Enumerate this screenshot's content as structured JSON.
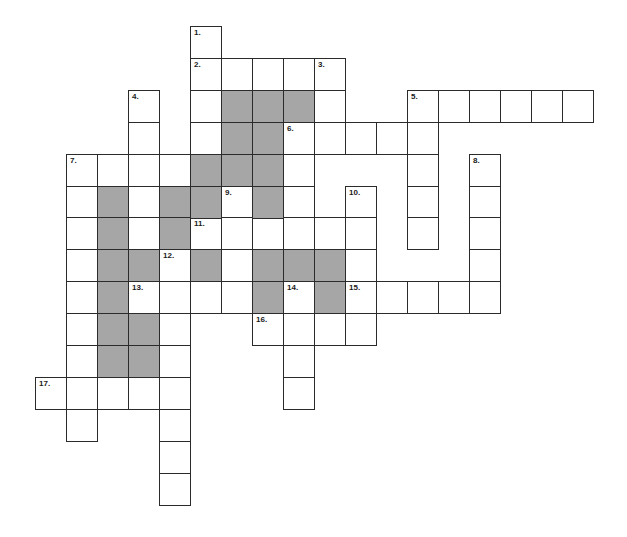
{
  "puzzle": {
    "type": "crossword",
    "grid": {
      "origin_x": 35,
      "origin_y": 26,
      "cell_w": 31,
      "cell_h": 31.9,
      "colors": {
        "border": "#2b2b2b",
        "white": "#ffffff",
        "shaded": "#a6a6a6"
      }
    },
    "entries": [
      {
        "number": "1.",
        "direction": "down",
        "col": 5,
        "row": 0,
        "length": 4
      },
      {
        "number": "2.",
        "direction": "across",
        "col": 5,
        "row": 1,
        "length": 5
      },
      {
        "number": "3.",
        "direction": "down",
        "col": 9,
        "row": 1,
        "length": 3
      },
      {
        "number": "4.",
        "direction": "down",
        "col": 3,
        "row": 2,
        "length": 5
      },
      {
        "number": "5.",
        "direction": "across",
        "col": 12,
        "row": 2,
        "length": 6
      },
      {
        "number": "5.",
        "direction": "down",
        "col": 12,
        "row": 2,
        "length": 5
      },
      {
        "number": "6.",
        "direction": "across",
        "col": 8,
        "row": 3,
        "length": 5
      },
      {
        "number": "6.",
        "direction": "down",
        "col": 8,
        "row": 3,
        "length": 4
      },
      {
        "number": "7.",
        "direction": "across",
        "col": 1,
        "row": 4,
        "length": 4
      },
      {
        "number": "7.",
        "direction": "down",
        "col": 1,
        "row": 4,
        "length": 9
      },
      {
        "number": "8.",
        "direction": "down",
        "col": 14,
        "row": 4,
        "length": 5
      },
      {
        "number": "9.",
        "direction": "down",
        "col": 6,
        "row": 5,
        "length": 4
      },
      {
        "number": "10.",
        "direction": "down",
        "col": 10,
        "row": 5,
        "length": 5
      },
      {
        "number": "11.",
        "direction": "across",
        "col": 5,
        "row": 6,
        "length": 6
      },
      {
        "number": "12.",
        "direction": "down",
        "col": 4,
        "row": 7,
        "length": 8
      },
      {
        "number": "13.",
        "direction": "across",
        "col": 3,
        "row": 8,
        "length": 4
      },
      {
        "number": "14.",
        "direction": "down",
        "col": 8,
        "row": 8,
        "length": 4
      },
      {
        "number": "15.",
        "direction": "across",
        "col": 10,
        "row": 8,
        "length": 5
      },
      {
        "number": "16.",
        "direction": "across",
        "col": 7,
        "row": 9,
        "length": 4
      },
      {
        "number": "17.",
        "direction": "across",
        "col": 0,
        "row": 11,
        "length": 5
      }
    ],
    "labels": [
      {
        "text": "1.",
        "col": 5,
        "row": 0
      },
      {
        "text": "2.",
        "col": 5,
        "row": 1
      },
      {
        "text": "3.",
        "col": 9,
        "row": 1
      },
      {
        "text": "4.",
        "col": 3,
        "row": 2
      },
      {
        "text": "5.",
        "col": 12,
        "row": 2
      },
      {
        "text": "6.",
        "col": 8,
        "row": 3
      },
      {
        "text": "7.",
        "col": 1,
        "row": 4
      },
      {
        "text": "8.",
        "col": 14,
        "row": 4
      },
      {
        "text": "9.",
        "col": 6,
        "row": 5
      },
      {
        "text": "10.",
        "col": 10,
        "row": 5
      },
      {
        "text": "11.",
        "col": 5,
        "row": 6
      },
      {
        "text": "12.",
        "col": 4,
        "row": 7
      },
      {
        "text": "13.",
        "col": 3,
        "row": 8
      },
      {
        "text": "14.",
        "col": 8,
        "row": 8
      },
      {
        "text": "15.",
        "col": 10,
        "row": 8
      },
      {
        "text": "16.",
        "col": 7,
        "row": 9
      },
      {
        "text": "17.",
        "col": 0,
        "row": 11
      }
    ],
    "shaded_cells": [
      [
        6,
        2
      ],
      [
        7,
        2
      ],
      [
        8,
        2
      ],
      [
        6,
        3
      ],
      [
        7,
        3
      ],
      [
        5,
        4
      ],
      [
        6,
        4
      ],
      [
        7,
        4
      ],
      [
        2,
        5
      ],
      [
        4,
        5
      ],
      [
        5,
        5
      ],
      [
        7,
        5
      ],
      [
        2,
        6
      ],
      [
        4,
        6
      ],
      [
        2,
        7
      ],
      [
        3,
        7
      ],
      [
        5,
        7
      ],
      [
        7,
        7
      ],
      [
        8,
        7
      ],
      [
        9,
        7
      ],
      [
        2,
        8
      ],
      [
        7,
        8
      ],
      [
        9,
        8
      ],
      [
        2,
        9
      ],
      [
        3,
        9
      ],
      [
        2,
        10
      ],
      [
        3,
        10
      ]
    ]
  }
}
